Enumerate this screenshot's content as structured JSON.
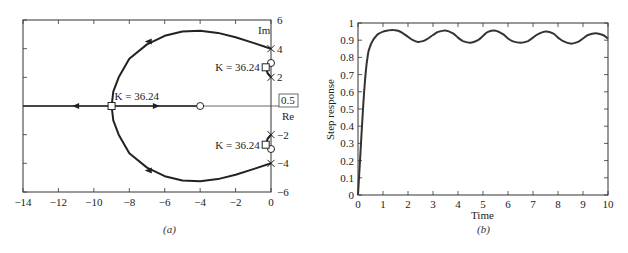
{
  "chart_data": [
    {
      "type": "scatter",
      "subtype": "root-locus",
      "caption": "(a)",
      "xlabel": "Re",
      "ylabel": "Im",
      "xlim": [
        -14,
        0
      ],
      "ylim": [
        -6,
        6
      ],
      "xticks": [
        -14,
        -12,
        -10,
        -8,
        -6,
        -4,
        -2,
        0
      ],
      "xtick_labels": [
        "−14",
        "−12",
        "−10",
        "−8",
        "−6",
        "−4",
        "−2",
        "0"
      ],
      "yticks": [
        6,
        4,
        2,
        -2,
        -4,
        -6
      ],
      "ytick_labels": [
        "6",
        "4",
        "2",
        "−2",
        "−4",
        "−6"
      ],
      "boxed_label": "0.5",
      "poles": [
        [
          0,
          4
        ],
        [
          0,
          2
        ],
        [
          0,
          -2
        ],
        [
          0,
          -4
        ]
      ],
      "zeros": [
        [
          -4,
          0
        ],
        [
          0,
          3
        ],
        [
          0,
          -3
        ]
      ],
      "gain_markers": [
        {
          "point": [
            -9,
            0
          ],
          "label": "K = 36.24"
        },
        {
          "point": [
            -0.3,
            2.7
          ],
          "label": "K = 36.24"
        },
        {
          "point": [
            -0.3,
            -2.7
          ],
          "label": "K = 36.24"
        }
      ],
      "branches": [
        {
          "name": "upper-branch",
          "points": [
            [
              0,
              4
            ],
            [
              -1,
              4.4
            ],
            [
              -2,
              4.8
            ],
            [
              -3,
              5.1
            ],
            [
              -4,
              5.25
            ],
            [
              -5,
              5.2
            ],
            [
              -6,
              4.9
            ],
            [
              -7,
              4.3
            ],
            [
              -8,
              3.3
            ],
            [
              -8.6,
              2
            ],
            [
              -8.9,
              1
            ],
            [
              -9,
              0
            ]
          ]
        },
        {
          "name": "lower-branch",
          "points": [
            [
              0,
              -4
            ],
            [
              -1,
              -4.4
            ],
            [
              -2,
              -4.8
            ],
            [
              -3,
              -5.1
            ],
            [
              -4,
              -5.25
            ],
            [
              -5,
              -5.2
            ],
            [
              -6,
              -4.9
            ],
            [
              -7,
              -4.3
            ],
            [
              -8,
              -3.3
            ],
            [
              -8.6,
              -2
            ],
            [
              -8.9,
              -1
            ],
            [
              -9,
              0
            ]
          ]
        },
        {
          "name": "upper-short-branch",
          "points": [
            [
              0,
              2
            ],
            [
              -0.2,
              2.3
            ],
            [
              -0.3,
              2.7
            ]
          ]
        },
        {
          "name": "lower-short-branch",
          "points": [
            [
              0,
              -2
            ],
            [
              -0.2,
              -2.3
            ],
            [
              -0.3,
              -2.7
            ]
          ]
        },
        {
          "name": "real-axis-left",
          "points": [
            [
              -9,
              0
            ],
            [
              -14,
              0
            ]
          ]
        },
        {
          "name": "real-axis-right",
          "points": [
            [
              -9,
              0
            ],
            [
              -4,
              0
            ]
          ]
        }
      ],
      "arrows": [
        {
          "at": [
            -6.9,
            4.5
          ],
          "dir": "left"
        },
        {
          "at": [
            -6.9,
            -4.5
          ],
          "dir": "left"
        },
        {
          "at": [
            -11,
            0
          ],
          "dir": "left"
        },
        {
          "at": [
            -6.5,
            0
          ],
          "dir": "right"
        }
      ]
    },
    {
      "type": "line",
      "caption": "(b)",
      "xlabel": "Time",
      "ylabel": "Step response",
      "xlim": [
        0,
        10
      ],
      "ylim": [
        0,
        1
      ],
      "xticks": [
        0,
        1,
        2,
        3,
        4,
        5,
        6,
        7,
        8,
        9,
        10
      ],
      "xtick_labels": [
        "0",
        "1",
        "2",
        "3",
        "4",
        "5",
        "6",
        "7",
        "8",
        "9",
        "10"
      ],
      "yticks": [
        0,
        0.1,
        0.2,
        0.3,
        0.4,
        0.5,
        0.6,
        0.7,
        0.8,
        0.9,
        1
      ],
      "ytick_labels": [
        "0",
        "0.1",
        "0.2",
        "0.3",
        "0.4",
        "0.5",
        "0.6",
        "0.7",
        "0.8",
        "0.9",
        "1"
      ],
      "series": [
        {
          "name": "step-response",
          "x": [
            0,
            0.1,
            0.2,
            0.3,
            0.4,
            0.5,
            0.6,
            0.7,
            0.8,
            1.0,
            1.2,
            1.4,
            1.6,
            1.8,
            2.0,
            2.2,
            2.4,
            2.6,
            2.8,
            3.0,
            3.2,
            3.5,
            3.8,
            4.0,
            4.2,
            4.5,
            4.8,
            5.0,
            5.2,
            5.5,
            5.8,
            6.0,
            6.2,
            6.5,
            6.8,
            7.0,
            7.2,
            7.5,
            7.8,
            8.0,
            8.2,
            8.5,
            8.8,
            9.0,
            9.2,
            9.5,
            9.8,
            10.0
          ],
          "y": [
            0,
            0.25,
            0.5,
            0.7,
            0.82,
            0.87,
            0.9,
            0.92,
            0.935,
            0.95,
            0.957,
            0.96,
            0.955,
            0.94,
            0.92,
            0.9,
            0.89,
            0.895,
            0.91,
            0.93,
            0.948,
            0.957,
            0.94,
            0.915,
            0.895,
            0.885,
            0.9,
            0.925,
            0.948,
            0.955,
            0.935,
            0.91,
            0.893,
            0.885,
            0.895,
            0.915,
            0.935,
            0.95,
            0.94,
            0.915,
            0.895,
            0.88,
            0.89,
            0.91,
            0.93,
            0.94,
            0.93,
            0.91
          ]
        }
      ]
    }
  ]
}
